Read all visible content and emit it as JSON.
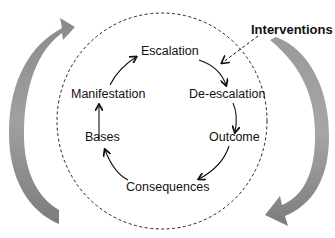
{
  "diagram": {
    "type": "cycle",
    "nodes": [
      {
        "id": "escalation",
        "label": "Escalation"
      },
      {
        "id": "de-escalation",
        "label": "De-escalation"
      },
      {
        "id": "outcome",
        "label": "Outcome"
      },
      {
        "id": "consequences",
        "label": "Consequences"
      },
      {
        "id": "bases",
        "label": "Bases"
      },
      {
        "id": "manifestation",
        "label": "Manifestation"
      }
    ],
    "edges": [
      {
        "from": "escalation",
        "to": "de-escalation"
      },
      {
        "from": "de-escalation",
        "to": "outcome"
      },
      {
        "from": "outcome",
        "to": "consequences"
      },
      {
        "from": "consequences",
        "to": "bases"
      },
      {
        "from": "bases",
        "to": "manifestation"
      },
      {
        "from": "manifestation",
        "to": "escalation"
      }
    ],
    "interventions": {
      "label": "Interventions",
      "target_edge": "escalation->de-escalation",
      "style": "dashed"
    },
    "boundary": {
      "style": "dashed-circle"
    },
    "outer_cycle": {
      "direction": "clockwise",
      "arrow_color": "#7a7a7a"
    }
  }
}
